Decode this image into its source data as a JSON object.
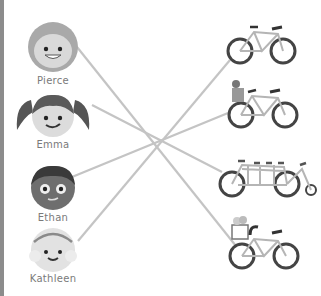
{
  "people": [
    {
      "name": "Pierce",
      "icon": "boy-curly-hair-avatar-icon"
    },
    {
      "name": "Emma",
      "icon": "girl-pigtails-avatar-icon"
    },
    {
      "name": "Ethan",
      "icon": "boy-dark-skin-avatar-icon"
    },
    {
      "name": "Kathleen",
      "icon": "girl-headband-avatar-icon"
    }
  ],
  "bikes": [
    {
      "type": "regular bicycle",
      "icon": "bicycle-icon"
    },
    {
      "type": "bicycle with child seat",
      "icon": "bicycle-child-seat-icon"
    },
    {
      "type": "tandem bicycle",
      "icon": "tandem-bicycle-icon"
    },
    {
      "type": "bicycle with flower basket",
      "icon": "bicycle-basket-icon"
    }
  ],
  "matches": [
    {
      "person": "Pierce",
      "bike": "bicycle with flower basket"
    },
    {
      "person": "Emma",
      "bike": "tandem bicycle"
    },
    {
      "person": "Ethan",
      "bike": "bicycle with child seat"
    },
    {
      "person": "Kathleen",
      "bike": "regular bicycle"
    }
  ],
  "colors": {
    "line": "#c4c4c4",
    "text": "#7a7a7a",
    "border": "#8c8c8c"
  }
}
